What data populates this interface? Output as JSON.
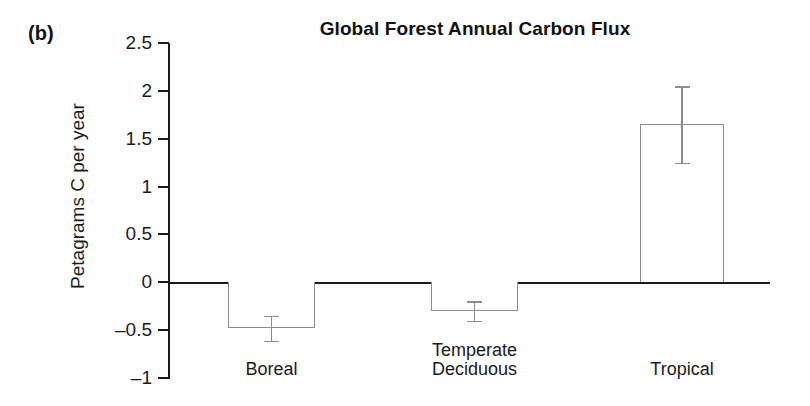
{
  "panel": {
    "label": "(b)"
  },
  "chart_data": {
    "type": "bar",
    "title": "Global Forest Annual Carbon Flux",
    "xlabel": "",
    "ylabel": "Petagrams C per year",
    "categories": [
      "Boreal",
      "Temperate\nDeciduous",
      "Tropical"
    ],
    "values": [
      -0.48,
      -0.3,
      1.65
    ],
    "errors": [
      0.13,
      0.1,
      0.4
    ],
    "ylim": [
      -1,
      2.5
    ],
    "ytick_labels": [
      "2.5",
      "2",
      "1.5",
      "1",
      "0.5",
      "0",
      "–0.5",
      "–1"
    ],
    "ytick_values": [
      2.5,
      2,
      1.5,
      1,
      0.5,
      0,
      -0.5,
      -1
    ],
    "grid": false,
    "legend": null,
    "bar_fill_color": "#ffffff",
    "bar_edge_color": "#8d8d8d",
    "axis_color": "#1a1a1a"
  }
}
